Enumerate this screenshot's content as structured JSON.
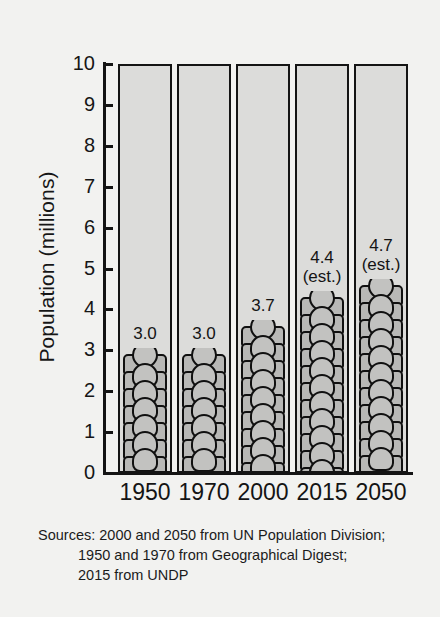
{
  "chart_data": {
    "type": "bar",
    "title": "",
    "xlabel": "",
    "ylabel": "Population (millions)",
    "categories": [
      "1950",
      "1970",
      "2000",
      "2015",
      "2050"
    ],
    "values": [
      3.0,
      3.7,
      4.4,
      4.7,
      3.0
    ],
    "series": [
      {
        "name": "Population",
        "values": [
          3.0,
          3.0,
          3.7,
          4.4,
          4.7
        ]
      }
    ],
    "data_labels": [
      "3.0",
      "3.0",
      "3.7",
      "4.4",
      "4.7"
    ],
    "estimate_flags": [
      "",
      "",
      "",
      "(est.)",
      "(est.)"
    ],
    "ylim": [
      0,
      10
    ],
    "yticks": [
      "0",
      "1",
      "2",
      "3",
      "4",
      "5",
      "6",
      "7",
      "8",
      "9",
      "10"
    ],
    "grid": false,
    "legend": "none",
    "style": "pictogram-stacked-bar",
    "colors": {
      "background": "#f2f2f0",
      "column_fill": "#dcdcda",
      "pictogram_fill": "#bdbdbb",
      "outline": "#141414",
      "text": "#161616"
    }
  },
  "axis": {
    "y_title": "Population (millions)"
  },
  "sources": {
    "line1": "Sources: 2000 and 2050 from UN Population Division;",
    "line2": "1950 and 1970 from Geographical Digest;",
    "line3": "2015 from UNDP"
  }
}
